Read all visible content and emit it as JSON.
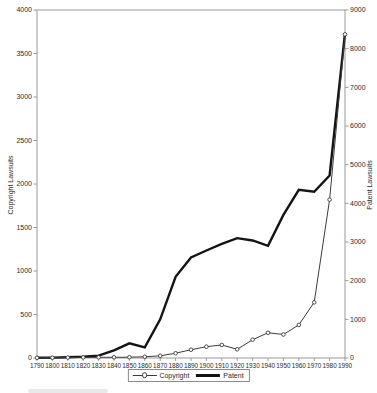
{
  "chart_data": {
    "type": "line",
    "title": "",
    "x": [
      1790,
      1800,
      1810,
      1820,
      1830,
      1840,
      1850,
      1860,
      1870,
      1880,
      1890,
      1900,
      1910,
      1920,
      1930,
      1940,
      1950,
      1960,
      1970,
      1980,
      1990
    ],
    "series": [
      {
        "name": "Copyright",
        "axis": "left",
        "marker": "circle",
        "style": "thin",
        "color": "#3c3c3c",
        "values": [
          2,
          3,
          5,
          7,
          8,
          8,
          9,
          14,
          25,
          55,
          95,
          130,
          150,
          100,
          210,
          290,
          270,
          380,
          640,
          1820,
          3720
        ]
      },
      {
        "name": "Patent",
        "axis": "right",
        "marker": "none",
        "style": "thick",
        "color": "#141414",
        "values": [
          5,
          10,
          20,
          35,
          60,
          200,
          380,
          275,
          1000,
          2100,
          2600,
          2780,
          2950,
          3100,
          3040,
          2900,
          3700,
          4350,
          4300,
          4720,
          8400
        ]
      }
    ],
    "left_axis": {
      "label": "Copyright Lawsuits",
      "min": 0,
      "max": 4000,
      "ticks": [
        0,
        500,
        1000,
        1500,
        2000,
        2500,
        3000,
        3500,
        4000
      ]
    },
    "right_axis": {
      "label": "Patent Lawsuits",
      "min": 0,
      "max": 9000,
      "ticks": [
        0,
        1000,
        2000,
        3000,
        4000,
        5000,
        6000,
        7000,
        8000,
        9000
      ]
    },
    "x_axis": {
      "tick_labels": [
        "1790",
        "1800",
        "1810",
        "1820",
        "1830",
        "1840",
        "1850",
        "1860",
        "1870",
        "1880",
        "1890",
        "1900",
        "1910",
        "1920",
        "1930",
        "1940",
        "1950",
        "1960",
        "1970",
        "1980",
        "1990"
      ]
    },
    "legend": {
      "position": "bottom-center",
      "entries": [
        "Copyright",
        "Patent"
      ]
    },
    "grid": "off",
    "colors": {
      "background": "#ffffff",
      "frame": "#9a9a9a",
      "tick_text": "#2b2b2b",
      "copyright_line": "#3c3c3c",
      "patent_line": "#141414"
    }
  }
}
